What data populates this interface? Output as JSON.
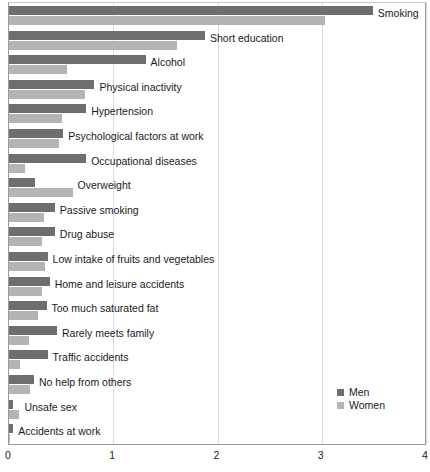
{
  "chart_data": {
    "type": "bar",
    "orientation": "horizontal",
    "title": "",
    "subtitle": "",
    "xlabel": "",
    "ylabel": "",
    "xlim": [
      0,
      4
    ],
    "xticks": [
      0,
      1,
      2,
      3,
      4
    ],
    "xtick_labels": [
      "0",
      "1",
      "2",
      "3",
      "4"
    ],
    "grid": "vertical-only",
    "legend_position": "bottom-right",
    "categories": [
      "Smoking",
      "Short education",
      "Alcohol",
      "Physical inactivity",
      "Hypertension",
      "Psychological factors at work",
      "Occupational diseases",
      "Overweight",
      "Passive smoking",
      "Drug abuse",
      "Low intake of fruits and vegetables",
      "Home and leisure accidents",
      "Too much saturated fat",
      "Rarely meets family",
      "Traffic accidents",
      "No help from others",
      "Unsafe sex",
      "Accidents at work"
    ],
    "series": [
      {
        "name": "Men",
        "color": "#6e6e6e",
        "values": [
          3.49,
          1.88,
          1.31,
          0.82,
          0.74,
          0.52,
          0.74,
          0.25,
          0.44,
          0.44,
          0.37,
          0.39,
          0.36,
          0.46,
          0.37,
          0.24,
          0.04,
          0.04
        ]
      },
      {
        "name": "Women",
        "color": "#b4b4b4",
        "values": [
          3.03,
          1.61,
          0.56,
          0.73,
          0.51,
          0.48,
          0.15,
          0.61,
          0.34,
          0.32,
          0.35,
          0.32,
          0.28,
          0.19,
          0.11,
          0.2,
          0.1,
          0.01
        ]
      }
    ]
  },
  "legend": {
    "items": [
      {
        "label": "Men",
        "swatch": "men"
      },
      {
        "label": "Women",
        "swatch": "women"
      }
    ]
  }
}
